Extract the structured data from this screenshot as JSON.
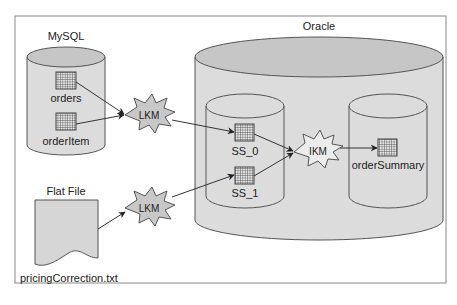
{
  "diagram": {
    "sources": {
      "mysql": {
        "title": "MySQL",
        "tables": [
          "orders",
          "orderItem"
        ]
      },
      "flat_file": {
        "title": "Flat File",
        "filename": "pricingCorrection.txt"
      }
    },
    "target": {
      "title": "Oracle",
      "staging": {
        "tables": [
          "SS_0",
          "SS_1"
        ]
      },
      "final": {
        "tables": [
          "orderSummary"
        ]
      }
    },
    "knowledge_modules": {
      "lkm_mysql": "LKM",
      "lkm_file": "LKM",
      "ikm": "IKM"
    },
    "colors": {
      "fill": "#d8d8d8",
      "fill_top": "#c4c4c4",
      "stroke": "#555555",
      "frame": "#888888"
    }
  }
}
